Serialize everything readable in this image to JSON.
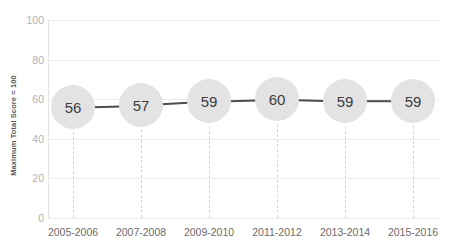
{
  "chart_data": {
    "type": "line",
    "title": "",
    "xlabel": "",
    "ylabel": "Maximum Total Score = 100",
    "categories": [
      "2005-2006",
      "2007-2008",
      "2009-2010",
      "2011-2012",
      "2013-2014",
      "2015-2016"
    ],
    "values": [
      56,
      57,
      59,
      60,
      59,
      59
    ],
    "point_labels": [
      "56",
      "57",
      "59",
      "60",
      "59",
      "59"
    ],
    "ylim": [
      0,
      100
    ],
    "yticks": [
      0,
      20,
      40,
      60,
      80,
      100
    ],
    "ytick_labels": [
      "0",
      "20",
      "40",
      "60",
      "80",
      "100"
    ],
    "grid": "horizontal",
    "legend": "none",
    "series": [
      {
        "name": "Maximum Total Score = 100",
        "values": [
          56,
          57,
          59,
          60,
          59,
          59
        ]
      }
    ],
    "colors": {
      "marker_fill": "#e3e3e3",
      "marker_text": "#3c3c3c",
      "line": "#4d4d4d",
      "gridline": "#ededed",
      "dropline": "#d5d5d5",
      "axis": "#e3e3e3",
      "ytick_text": "#b3b3b3",
      "xtick_text": "#6b6b6b",
      "axis_title": "#58595b",
      "background": "#ffffff"
    }
  }
}
